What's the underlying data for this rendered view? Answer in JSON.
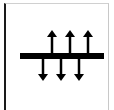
{
  "diagram": {
    "bar_color": "#000000",
    "up_arrows": 3,
    "down_arrows": 3
  }
}
